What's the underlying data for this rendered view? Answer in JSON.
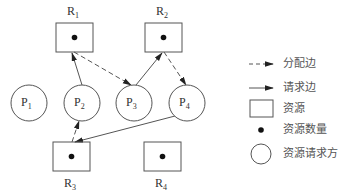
{
  "diagram": {
    "colors": {
      "stroke": "#555555",
      "dot": "#111111",
      "text": "#333333",
      "background": "#ffffff"
    },
    "resources": [
      {
        "id": "R1",
        "name": "R",
        "sub": "1",
        "x": 56,
        "y": 23,
        "w": 37,
        "h": 29,
        "label_x": 67,
        "label_y": 5,
        "units": 1
      },
      {
        "id": "R2",
        "name": "R",
        "sub": "2",
        "x": 145,
        "y": 23,
        "w": 37,
        "h": 29,
        "label_x": 156,
        "label_y": 5,
        "units": 1
      },
      {
        "id": "R3",
        "name": "R",
        "sub": "3",
        "x": 53,
        "y": 142,
        "w": 37,
        "h": 29,
        "label_x": 64,
        "label_y": 177,
        "units": 1
      },
      {
        "id": "R4",
        "name": "R",
        "sub": "4",
        "x": 144,
        "y": 142,
        "w": 37,
        "h": 29,
        "label_x": 155,
        "label_y": 177,
        "units": 1
      }
    ],
    "processes": [
      {
        "id": "P1",
        "name": "P",
        "sub": "1",
        "cx": 29,
        "cy": 103,
        "r": 18
      },
      {
        "id": "P2",
        "name": "P",
        "sub": "2",
        "cx": 82,
        "cy": 103,
        "r": 18
      },
      {
        "id": "P3",
        "name": "P",
        "sub": "3",
        "cx": 134,
        "cy": 103,
        "r": 18
      },
      {
        "id": "P4",
        "name": "P",
        "sub": "4",
        "cx": 187,
        "cy": 103,
        "r": 18
      }
    ],
    "edges": [
      {
        "from": "P2",
        "to": "R1",
        "type": "request",
        "x1": 82,
        "y1": 85,
        "x2": 72,
        "y2": 53
      },
      {
        "from": "R1",
        "to": "P3",
        "type": "allocation",
        "x1": 74,
        "y1": 52,
        "x2": 131,
        "y2": 85
      },
      {
        "from": "P3",
        "to": "R2",
        "type": "request",
        "x1": 136,
        "y1": 85,
        "x2": 162,
        "y2": 53
      },
      {
        "from": "R2",
        "to": "P4",
        "type": "allocation",
        "x1": 164,
        "y1": 52,
        "x2": 186,
        "y2": 85
      },
      {
        "from": "R3",
        "to": "P2",
        "type": "allocation",
        "x1": 72,
        "y1": 142,
        "x2": 79,
        "y2": 121
      },
      {
        "from": "P4",
        "to": "R3",
        "type": "request",
        "x1": 175,
        "y1": 116,
        "x2": 75,
        "y2": 142
      }
    ]
  },
  "legend": {
    "items": [
      {
        "symbol": "dashed-arrow",
        "label": "分配边"
      },
      {
        "symbol": "solid-arrow",
        "label": "请求边"
      },
      {
        "symbol": "rectangle",
        "label": "资源"
      },
      {
        "symbol": "dot",
        "label": "资源数量"
      },
      {
        "symbol": "circle",
        "label": "资源请求方"
      }
    ]
  }
}
